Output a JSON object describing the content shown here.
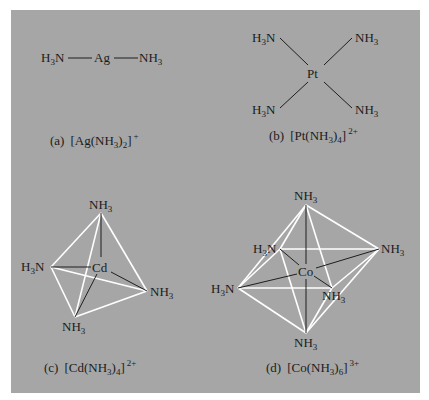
{
  "colors": {
    "background": "#ffffff",
    "panel": "#a6a6a6",
    "bond": "#1e1e1e",
    "polyhedron_edge": "#ffffff",
    "text": "#1c1c1c"
  },
  "figures": [
    {
      "id": "a",
      "caption_letter": "(a)",
      "formula": "[Ag(NH3)2]+",
      "caption": {
        "prefix": "(a)",
        "metal": "Ag",
        "ligand": "NH",
        "lig_sub": "3",
        "count": "2",
        "charge": "+"
      },
      "geometry": "linear",
      "central_atom": "Ag",
      "ligands": [
        "H3N",
        "NH3"
      ]
    },
    {
      "id": "b",
      "caption_letter": "(b)",
      "formula": "[Pt(NH3)4]2+",
      "caption": {
        "prefix": "(b)",
        "metal": "Pt",
        "ligand": "NH",
        "lig_sub": "3",
        "count": "4",
        "charge": "2+"
      },
      "geometry": "square planar",
      "central_atom": "Pt",
      "ligands": [
        "H3N",
        "NH3",
        "H3N",
        "NH3"
      ]
    },
    {
      "id": "c",
      "caption_letter": "(c)",
      "formula": "[Cd(NH3)4]2+",
      "caption": {
        "prefix": "(c)",
        "metal": "Cd",
        "ligand": "NH",
        "lig_sub": "3",
        "count": "4",
        "charge": "2+"
      },
      "geometry": "tetrahedral",
      "central_atom": "Cd",
      "ligands": [
        "NH3",
        "H3N",
        "NH3",
        "NH3"
      ]
    },
    {
      "id": "d",
      "caption_letter": "(d)",
      "formula": "[Co(NH3)6]3+",
      "caption": {
        "prefix": "(d)",
        "metal": "Co",
        "ligand": "NH",
        "lig_sub": "3",
        "count": "6",
        "charge": "3+"
      },
      "geometry": "octahedral",
      "central_atom": "Co",
      "ligands": [
        "NH3",
        "H3N",
        "NH3",
        "H3N",
        "NH3",
        "NH3"
      ]
    }
  ],
  "atoms": {
    "h": "H",
    "n": "N",
    "nh": "NH",
    "three": "3"
  }
}
